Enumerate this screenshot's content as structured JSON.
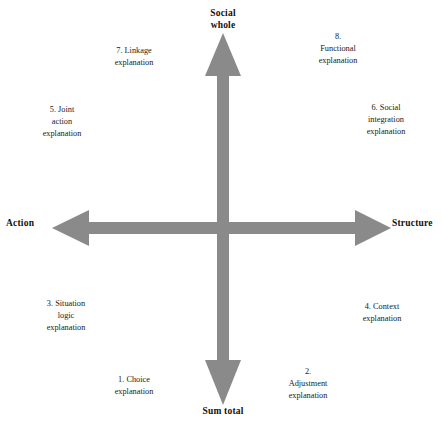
{
  "diagram": {
    "axis_color": "#8a8a8a",
    "text_color": "#1a1a1a",
    "background": "#ffffff",
    "poles": {
      "top": "Social\nwhole",
      "bottom": "Sum total",
      "left": "Action",
      "right": "Structure"
    },
    "quadrant_labels": [
      {
        "id": "1",
        "text": "1. Choice\nexplanation"
      },
      {
        "id": "2",
        "text": "2.\nAdjustment\nexplanation"
      },
      {
        "id": "3",
        "text": "3. Situation\nlogic\nexplanation"
      },
      {
        "id": "4",
        "text": "4. Context\nexplanation"
      },
      {
        "id": "5",
        "text": "5. Joint\naction\nexplanation"
      },
      {
        "id": "6",
        "text": "6. Social\nintegration\nexplanation"
      },
      {
        "id": "7",
        "text": "7. Linkage\nexplanation"
      },
      {
        "id": "8",
        "text": "8.\nFunctional\nexplanation"
      }
    ]
  }
}
